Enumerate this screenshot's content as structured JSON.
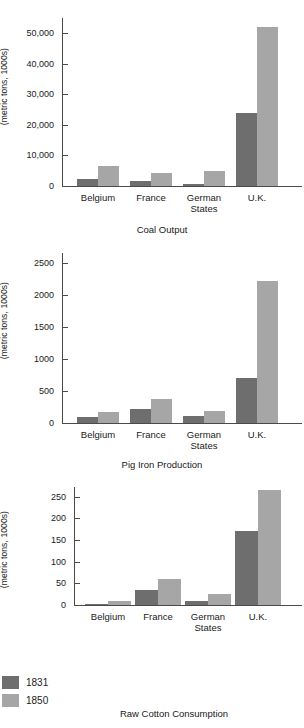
{
  "legend": {
    "items": [
      {
        "label": "1831",
        "color": "#6e6e6e"
      },
      {
        "label": "1850",
        "color": "#a6a6a6"
      }
    ]
  },
  "chart_data": [
    {
      "type": "bar",
      "title": "Coal Output",
      "xlabel": "",
      "ylabel": "(metric tons, 1000s)",
      "categories": [
        "Belgium",
        "France",
        "German\nStates",
        "U.K."
      ],
      "series": [
        {
          "name": "1831",
          "color": "#6e6e6e",
          "values": [
            2400,
            1600,
            800,
            24000
          ]
        },
        {
          "name": "1850",
          "color": "#a6a6a6",
          "values": [
            6500,
            4300,
            4800,
            52000
          ]
        }
      ],
      "ylim": [
        0,
        55000
      ],
      "yticks": [
        0,
        10000,
        20000,
        30000,
        40000,
        50000
      ],
      "yticklabels": [
        "0",
        "10,000",
        "20,000",
        "30,000",
        "40,000",
        "50,000"
      ],
      "grid": false,
      "legend_position": "bottom-left"
    },
    {
      "type": "bar",
      "title": "Pig Iron Production",
      "xlabel": "",
      "ylabel": "(metric tons, 1000s)",
      "categories": [
        "Belgium",
        "France",
        "German\nStates",
        "U.K."
      ],
      "series": [
        {
          "name": "1831",
          "color": "#6e6e6e",
          "values": [
            90,
            220,
            110,
            700
          ]
        },
        {
          "name": "1850",
          "color": "#a6a6a6",
          "values": [
            170,
            370,
            190,
            2220
          ]
        }
      ],
      "ylim": [
        0,
        2650
      ],
      "yticks": [
        0,
        500,
        1000,
        1500,
        2000,
        2500
      ],
      "yticklabels": [
        "0",
        "500",
        "1000",
        "1500",
        "2000",
        "2500"
      ],
      "grid": false,
      "legend_position": "bottom-left"
    },
    {
      "type": "bar",
      "title": "Raw Cotton Consumption",
      "xlabel": "",
      "ylabel": "(metric tons, 1000s)",
      "categories": [
        "Belgium",
        "France",
        "German\nStates",
        "U.K."
      ],
      "series": [
        {
          "name": "1831",
          "color": "#6e6e6e",
          "values": [
            2,
            34,
            9,
            170
          ]
        },
        {
          "name": "1850",
          "color": "#a6a6a6",
          "values": [
            10,
            59,
            26,
            265
          ]
        }
      ],
      "ylim": [
        0,
        272
      ],
      "yticks": [
        0,
        50,
        100,
        150,
        200,
        250
      ],
      "yticklabels": [
        "0",
        "50",
        "100",
        "150",
        "200",
        "250"
      ],
      "grid": false,
      "legend_position": "bottom-left"
    }
  ]
}
